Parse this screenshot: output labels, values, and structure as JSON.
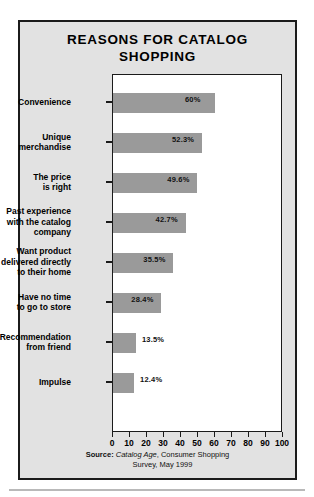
{
  "chart_data": {
    "type": "bar",
    "orientation": "horizontal",
    "title": "REASONS FOR CATALOG SHOPPING",
    "title_lines": [
      "REASONS FOR CATALOG",
      "SHOPPING"
    ],
    "categories": [
      "Convenience",
      "Unique merchandise",
      "The price is right",
      "Past experience with the catalog company",
      "Want product delivered directly to their home",
      "Have no time to go to store",
      "Recommendation from friend",
      "Impulse"
    ],
    "category_lines": [
      [
        "Convenience"
      ],
      [
        "Unique",
        "merchandise"
      ],
      [
        "The price",
        "is right"
      ],
      [
        "Past experience",
        "with the catalog",
        "company"
      ],
      [
        "Want product",
        "delivered directly",
        "to their home"
      ],
      [
        "Have no time",
        "to go to store"
      ],
      [
        "Recommendation",
        "from friend"
      ],
      [
        "Impulse"
      ]
    ],
    "values": [
      60,
      52.3,
      49.6,
      42.7,
      35.5,
      28.4,
      13.5,
      12.4
    ],
    "value_labels": [
      "60%",
      "52.3%",
      "49.6%",
      "42.7%",
      "35.5%",
      "28.4%",
      "13.5%",
      "12.4%"
    ],
    "xlabel": "",
    "ylabel": "",
    "xlim": [
      0,
      100
    ],
    "xticks": [
      0,
      10,
      20,
      30,
      40,
      50,
      60,
      70,
      80,
      90,
      100
    ],
    "xtick_labels": [
      "0",
      "10",
      "20",
      "30",
      "40",
      "50",
      "60",
      "70",
      "80",
      "90",
      "100"
    ],
    "grid": false,
    "legend": null,
    "bar_color": "#9a9a9a",
    "panel_color": "#e2e2e2",
    "plot_background": "#ffffff",
    "border_color": "#1b1b1b"
  },
  "source": {
    "label": "Source:",
    "publication": "Catalog Age",
    "rest_line1": ", Consumer Shopping",
    "line2": "Survey, May 1999"
  }
}
